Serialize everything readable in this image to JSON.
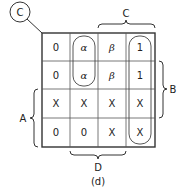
{
  "diagram": {
    "corner_label": "C",
    "caption": "(d)",
    "variable_labels": {
      "top": "C",
      "right": "B",
      "left": "A",
      "bottom": "D"
    },
    "grid": {
      "rows": 4,
      "cols": 4,
      "cells": [
        [
          "0",
          "α",
          "β",
          "1"
        ],
        [
          "0",
          "α",
          "β",
          "1"
        ],
        [
          "X",
          "X",
          "X",
          "X"
        ],
        [
          "0",
          "0",
          "X",
          "X"
        ]
      ]
    },
    "groupings": [
      {
        "name": "alpha-loop",
        "col": 1,
        "row_start": 0,
        "row_end": 1
      },
      {
        "name": "ones-loop",
        "col": 3,
        "row_start": 0,
        "row_end": 3
      }
    ]
  }
}
